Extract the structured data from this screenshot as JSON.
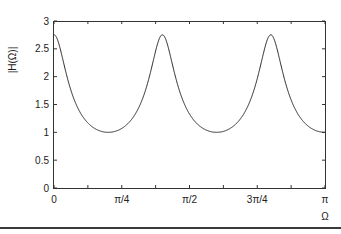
{
  "chart_data": {
    "type": "line",
    "title": "",
    "xlabel": "Ω",
    "ylabel": "|H(Ω)|",
    "xlim": [
      0,
      3.14159
    ],
    "ylim": [
      0,
      3
    ],
    "grid": false,
    "legend": null,
    "x_ticks": [
      {
        "value": 0,
        "label": "0"
      },
      {
        "value": 0.7854,
        "label": "π/4"
      },
      {
        "value": 1.5708,
        "label": "π/2"
      },
      {
        "value": 2.3562,
        "label": "3π/4"
      },
      {
        "value": 3.14159,
        "label": "π"
      }
    ],
    "x_minor_ticks": [
      0.3927,
      1.1781,
      1.9635,
      2.7489
    ],
    "y_ticks": [
      {
        "value": 0,
        "label": "0"
      },
      {
        "value": 0.5,
        "label": "0.5"
      },
      {
        "value": 1,
        "label": "1"
      },
      {
        "value": 1.5,
        "label": "1.5"
      },
      {
        "value": 2,
        "label": "2"
      },
      {
        "value": 2.5,
        "label": "2.5"
      },
      {
        "value": 3,
        "label": "3"
      }
    ],
    "series": [
      {
        "name": "|H(Ω)|",
        "color": "#222222",
        "description": "Periodic magnitude response with 6 peaks (~2.75) at Ω = kπ/5, k=0..5, and flat minima ≈1.0 between peaks",
        "peaks_x": [
          0,
          0.6283,
          1.2566,
          1.885,
          2.5133,
          3.14159
        ],
        "peak_value": 2.75,
        "min_value": 1.0,
        "model": {
          "a": 0.467,
          "N": 5
        }
      }
    ]
  },
  "labels": {
    "ylabel": "|H(Ω)|",
    "xlabel": "Ω"
  }
}
